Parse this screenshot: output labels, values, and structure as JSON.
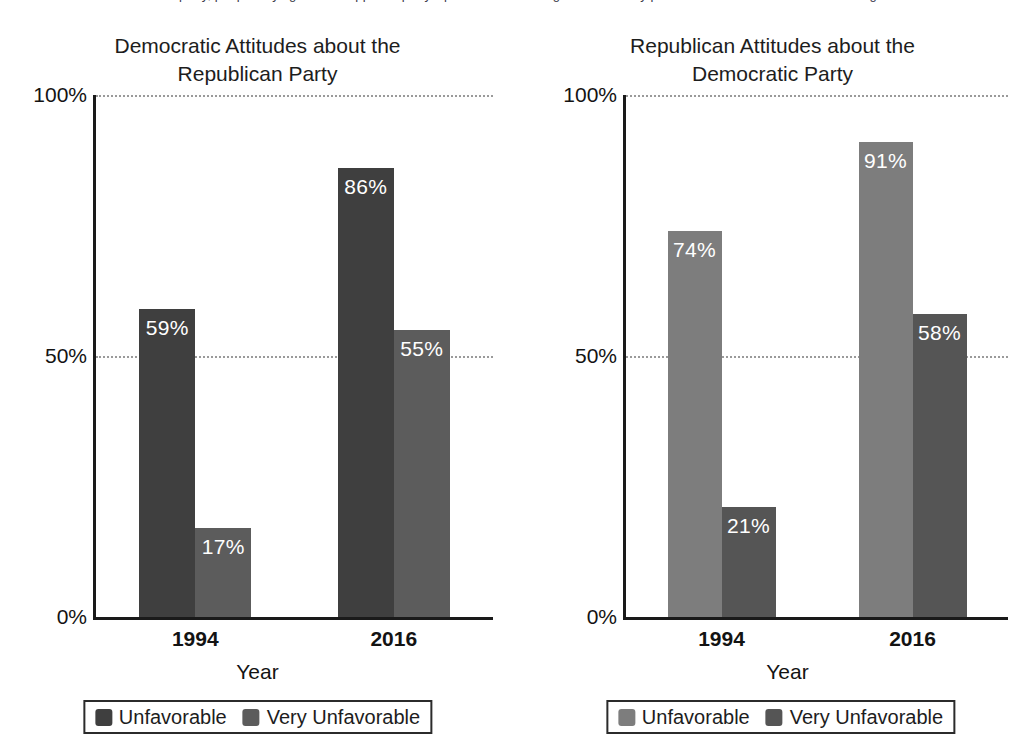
{
  "top_sliver_text": "of a party, people saying that the opposite party's policies are so misguided that they pose a threat to the nation's well-being",
  "chart_data": [
    {
      "type": "bar",
      "title": "Democratic Attitudes about the Republican Party",
      "title_line1": "Democratic Attitudes about the",
      "title_line2": "Republican Party",
      "xlabel": "Year",
      "ylabel": "",
      "categories": [
        "1994",
        "2016"
      ],
      "ylim": [
        0,
        100
      ],
      "yticks": [
        "0%",
        "50%",
        "100%"
      ],
      "grid": true,
      "legend_position": "bottom",
      "series": [
        {
          "name": "Unfavorable",
          "color": "#3f3f3f",
          "values": [
            59,
            86
          ],
          "labels": [
            "59%",
            "86%"
          ]
        },
        {
          "name": "Very Unfavorable",
          "color": "#5c5c5c",
          "values": [
            17,
            55
          ],
          "labels": [
            "17%",
            "55%"
          ]
        }
      ]
    },
    {
      "type": "bar",
      "title": "Republican Attitudes about the Democratic Party",
      "title_line1": "Republican Attitudes about the",
      "title_line2": "Democratic Party",
      "xlabel": "Year",
      "ylabel": "",
      "categories": [
        "1994",
        "2016"
      ],
      "ylim": [
        0,
        100
      ],
      "yticks": [
        "0%",
        "50%",
        "100%"
      ],
      "grid": true,
      "legend_position": "bottom",
      "series": [
        {
          "name": "Unfavorable",
          "color": "#7d7d7d",
          "values": [
            74,
            91
          ],
          "labels": [
            "74%",
            "91%"
          ]
        },
        {
          "name": "Very Unfavorable",
          "color": "#555555",
          "values": [
            21,
            58
          ],
          "labels": [
            "21%",
            "58%"
          ]
        }
      ]
    }
  ]
}
